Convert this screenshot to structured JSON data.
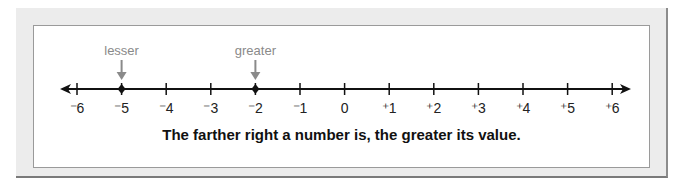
{
  "number_line": {
    "ticks": [
      {
        "label": "⁻6",
        "value": -6
      },
      {
        "label": "⁻5",
        "value": -5
      },
      {
        "label": "⁻4",
        "value": -4
      },
      {
        "label": "⁻3",
        "value": -3
      },
      {
        "label": "⁻2",
        "value": -2
      },
      {
        "label": "⁻1",
        "value": -1
      },
      {
        "label": "0",
        "value": 0
      },
      {
        "label": "⁺1",
        "value": 1
      },
      {
        "label": "⁺2",
        "value": 2
      },
      {
        "label": "⁺3",
        "value": 3
      },
      {
        "label": "⁺4",
        "value": 4
      },
      {
        "label": "⁺5",
        "value": 5
      },
      {
        "label": "⁺6",
        "value": 6
      }
    ],
    "points": [
      {
        "value": -5,
        "label": "lesser"
      },
      {
        "value": -2,
        "label": "greater"
      }
    ],
    "arrows": [
      "left",
      "right"
    ],
    "colors": {
      "line": "#111111",
      "annotation": "#8a8a8a"
    }
  },
  "caption": "The farther right a number is, the greater its value."
}
